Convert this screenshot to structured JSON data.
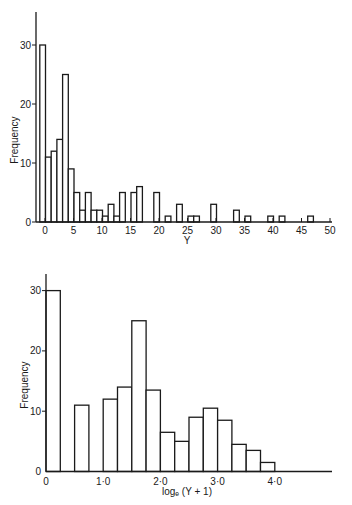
{
  "chart_data": [
    {
      "type": "bar",
      "title": "",
      "xlabel": "Y",
      "ylabel": "Frequency",
      "xlim": [
        -1,
        50
      ],
      "ylim": [
        0,
        36
      ],
      "grid": false,
      "x_ticks": [
        0,
        5,
        10,
        15,
        20,
        25,
        30,
        35,
        40,
        45,
        50
      ],
      "x_tick_labels": [
        "0",
        "5",
        "10",
        "15",
        "20",
        "25",
        "30",
        "35",
        "40",
        "45",
        "50"
      ],
      "y_ticks": [
        0,
        10,
        20,
        30
      ],
      "y_tick_labels": [
        "0",
        "10",
        "20",
        "30"
      ],
      "categories": [
        0,
        1,
        2,
        3,
        4,
        5,
        6,
        7,
        8,
        9,
        10,
        11,
        12,
        13,
        14,
        16,
        17,
        20,
        22,
        24,
        26,
        27,
        30,
        34,
        36,
        40,
        42,
        47
      ],
      "values": [
        30,
        11,
        12,
        14,
        25,
        9,
        5,
        2,
        5,
        2,
        2,
        1,
        3,
        1,
        5,
        5,
        6,
        5,
        1,
        3,
        1,
        1,
        3,
        2,
        1,
        1,
        1,
        1
      ]
    },
    {
      "type": "bar",
      "title": "",
      "xlabel": "logₑ (Y + 1)",
      "ylabel": "Frequency",
      "xlim": [
        0,
        5
      ],
      "ylim": [
        0,
        33
      ],
      "grid": false,
      "bin_width": 0.25,
      "x_ticks": [
        0,
        1,
        2,
        3,
        4
      ],
      "x_tick_labels": [
        "0",
        "1·0",
        "2·0",
        "3·0",
        "4·0"
      ],
      "y_ticks": [
        0,
        10,
        20,
        30
      ],
      "y_tick_labels": [
        "0",
        "10",
        "20",
        "30"
      ],
      "bins": [
        [
          0.0,
          0.25
        ],
        [
          0.5,
          0.75
        ],
        [
          1.0,
          1.25
        ],
        [
          1.25,
          1.5
        ],
        [
          1.5,
          1.75
        ],
        [
          1.75,
          2.0
        ],
        [
          2.0,
          2.25
        ],
        [
          2.25,
          2.5
        ],
        [
          2.5,
          2.75
        ],
        [
          2.75,
          3.0
        ],
        [
          3.0,
          3.25
        ],
        [
          3.25,
          3.5
        ],
        [
          3.5,
          3.75
        ],
        [
          3.75,
          4.0
        ]
      ],
      "values": [
        30,
        11,
        12,
        14,
        25,
        13.5,
        6.5,
        5,
        9,
        10.5,
        8.5,
        4.5,
        3.5,
        1.5
      ]
    }
  ]
}
